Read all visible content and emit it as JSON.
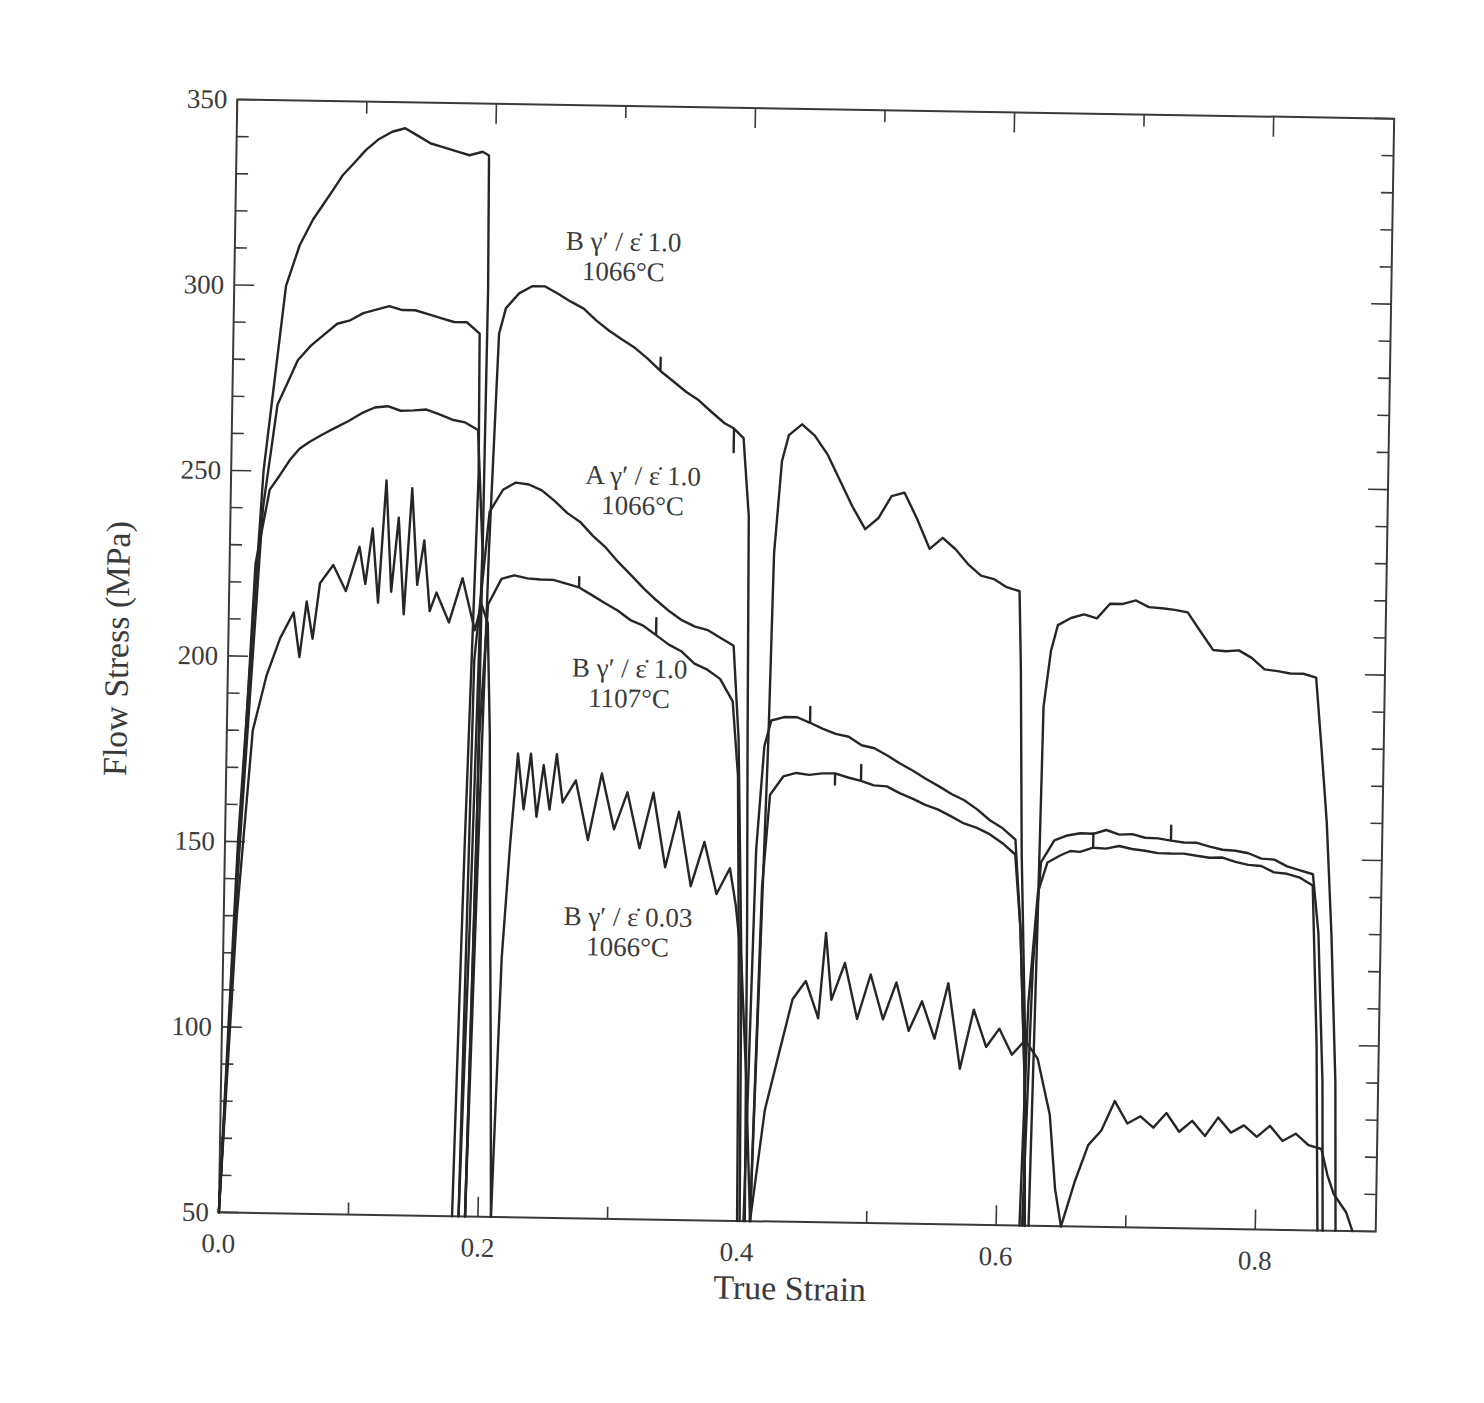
{
  "chart_data": {
    "type": "line",
    "title": "",
    "xlabel": "True Strain",
    "ylabel": "Flow Stress  (MPa)",
    "xlim": [
      0.0,
      0.893
    ],
    "ylim": [
      50,
      350
    ],
    "grid": false,
    "legend": "none (curves labelled by inline annotations)",
    "x_ticks": {
      "major": [
        0.0,
        0.2,
        0.4,
        0.6,
        0.8
      ],
      "minor_step": 0.1,
      "labels": [
        "0.0",
        "0.2",
        "0.4",
        "0.6",
        "0.8"
      ]
    },
    "y_ticks": {
      "major": [
        50,
        100,
        150,
        200,
        250,
        300,
        350
      ],
      "minor_step": 10,
      "labels": [
        "50",
        "100",
        "150",
        "200",
        "250",
        "300",
        "350"
      ]
    },
    "annotations": [
      {
        "line1": "B γ′ / ε̇ 1.0",
        "line2": "1066°C",
        "x": 0.3,
        "y": 311
      },
      {
        "line1": "A γ′ / ε̇ 1.0",
        "line2": "1066°C",
        "x": 0.318,
        "y": 248
      },
      {
        "line1": "B γ′ / ε̇ 1.0",
        "line2": "1107°C",
        "x": 0.31,
        "y": 196
      },
      {
        "line1": "B γ′ / ε̇ 0.03",
        "line2": "1066°C",
        "x": 0.312,
        "y": 129
      }
    ],
    "series": [
      {
        "name": "B γ′ / ε̇ 1.0, 1066°C",
        "passes": [
          {
            "x": [
              0.0,
              0.01,
              0.025,
              0.04,
              0.05,
              0.06,
              0.075,
              0.09,
              0.1,
              0.11,
              0.12,
              0.13,
              0.14,
              0.15,
              0.16,
              0.17,
              0.18,
              0.19,
              0.195,
              0.196,
              0.194,
              0.19
            ],
            "y": [
              50,
              150,
              250,
              300,
              311,
              318,
              326,
              333,
              337,
              340,
              342,
              343,
              341,
              339,
              338,
              337,
              336,
              337,
              336,
              300,
              150,
              50
            ]
          },
          {
            "x": [
              0.19,
              0.2,
              0.205,
              0.21,
              0.22,
              0.23,
              0.24,
              0.26,
              0.28,
              0.3,
              0.32,
              0.34,
              0.36,
              0.38,
              0.395,
              0.4,
              0.402,
              0.404,
              0.405,
              0.406
            ],
            "y": [
              50,
              230,
              288,
              295,
              299,
              301,
              301,
              297,
              292,
              287,
              282,
              276,
              271,
              265,
              261,
              240,
              180,
              130,
              90,
              50
            ]
          },
          {
            "x": [
              0.41,
              0.418,
              0.42,
              0.425,
              0.43,
              0.44,
              0.45,
              0.46,
              0.47,
              0.48,
              0.49,
              0.5,
              0.51,
              0.52,
              0.53,
              0.54,
              0.55,
              0.56,
              0.57,
              0.58,
              0.6,
              0.61,
              0.612,
              0.615,
              0.62,
              0.622
            ],
            "y": [
              50,
              180,
              230,
              255,
              262,
              265,
              262,
              257,
              250,
              243,
              237,
              240,
              246,
              247,
              240,
              232,
              235,
              232,
              228,
              225,
              222,
              221,
              200,
              150,
              100,
              50
            ]
          },
          {
            "x": [
              0.625,
              0.628,
              0.63,
              0.635,
              0.64,
              0.65,
              0.66,
              0.67,
              0.68,
              0.69,
              0.7,
              0.72,
              0.74,
              0.75,
              0.76,
              0.78,
              0.8,
              0.82,
              0.83,
              0.84,
              0.845,
              0.85,
              0.855,
              0.86,
              0.862
            ],
            "y": [
              50,
              130,
              190,
              205,
              212,
              214,
              215,
              214,
              218,
              218,
              219,
              217,
              216,
              211,
              206,
              206,
              201,
              200,
              200,
              199,
              180,
              160,
              130,
              90,
              50
            ]
          }
        ]
      },
      {
        "name": "A γ′ / ε̇ 1.0, 1066°C",
        "passes": [
          {
            "x": [
              0.0,
              0.01,
              0.025,
              0.035,
              0.05,
              0.06,
              0.07,
              0.08,
              0.09,
              0.1,
              0.11,
              0.12,
              0.13,
              0.14,
              0.15,
              0.16,
              0.17,
              0.18,
              0.19,
              0.191,
              0.185,
              0.18
            ],
            "y": [
              50,
              140,
              240,
              268,
              280,
              284,
              287,
              290,
              291,
              293,
              294,
              295,
              294,
              294,
              293,
              292,
              291,
              291,
              288,
              250,
              150,
              50
            ]
          },
          {
            "x": [
              0.185,
              0.19,
              0.2,
              0.21,
              0.22,
              0.24,
              0.26,
              0.28,
              0.3,
              0.32,
              0.34,
              0.36,
              0.38,
              0.39,
              0.395,
              0.4,
              0.402
            ],
            "y": [
              50,
              200,
              240,
              246,
              248,
              246,
              240,
              234,
              227,
              220,
              214,
              210,
              207,
              205,
              180,
              120,
              50
            ]
          },
          {
            "x": [
              0.405,
              0.41,
              0.415,
              0.42,
              0.43,
              0.44,
              0.46,
              0.48,
              0.5,
              0.52,
              0.54,
              0.56,
              0.58,
              0.6,
              0.61,
              0.615,
              0.62,
              0.622
            ],
            "y": [
              50,
              150,
              178,
              185,
              186,
              186,
              183,
              181,
              178,
              174,
              170,
              166,
              162,
              157,
              154,
              130,
              90,
              50
            ]
          },
          {
            "x": [
              0.62,
              0.625,
              0.63,
              0.64,
              0.66,
              0.68,
              0.7,
              0.72,
              0.74,
              0.76,
              0.78,
              0.8,
              0.82,
              0.83,
              0.84,
              0.845,
              0.85,
              0.852
            ],
            "y": [
              50,
              120,
              148,
              154,
              156,
              157,
              156,
              155,
              154,
              153,
              152,
              150,
              148,
              147,
              146,
              130,
              90,
              50
            ]
          }
        ]
      },
      {
        "name": "B γ′ / ε̇ 1.0, 1107°C",
        "passes": [
          {
            "x": [
              0.0,
              0.01,
              0.02,
              0.03,
              0.045,
              0.06,
              0.08,
              0.1,
              0.12,
              0.14,
              0.16,
              0.18,
              0.19,
              0.195,
              0.19,
              0.185
            ],
            "y": [
              50,
              140,
              225,
              245,
              253,
              258,
              262,
              266,
              268,
              267,
              266,
              264,
              262,
              230,
              130,
              50
            ]
          },
          {
            "x": [
              0.19,
              0.195,
              0.2,
              0.21,
              0.22,
              0.24,
              0.26,
              0.28,
              0.3,
              0.32,
              0.34,
              0.36,
              0.38,
              0.39,
              0.395,
              0.398,
              0.4
            ],
            "y": [
              50,
              180,
              215,
              222,
              223,
              222,
              221,
              218,
              214,
              210,
              205,
              200,
              196,
              190,
              170,
              120,
              50
            ]
          },
          {
            "x": [
              0.41,
              0.415,
              0.42,
              0.43,
              0.44,
              0.46,
              0.48,
              0.5,
              0.52,
              0.54,
              0.56,
              0.58,
              0.6,
              0.61,
              0.615,
              0.62,
              0.622
            ],
            "y": [
              50,
              140,
              165,
              170,
              171,
              171,
              170,
              168,
              166,
              163,
              160,
              157,
              153,
              150,
              130,
              90,
              50
            ]
          },
          {
            "x": [
              0.618,
              0.622,
              0.628,
              0.635,
              0.645,
              0.66,
              0.68,
              0.7,
              0.72,
              0.74,
              0.76,
              0.78,
              0.8,
              0.82,
              0.83,
              0.84,
              0.845,
              0.848
            ],
            "y": [
              50,
              110,
              140,
              148,
              150,
              151,
              152,
              152,
              151,
              151,
              150,
              149,
              148,
              146,
              145,
              143,
              100,
              50
            ]
          }
        ]
      },
      {
        "name": "B γ′ / ε̇ 0.03, 1066°C",
        "passes": [
          {
            "x": [
              0.0,
              0.01,
              0.02,
              0.03,
              0.04,
              0.05,
              0.055,
              0.06,
              0.065,
              0.07,
              0.08,
              0.09,
              0.1,
              0.105,
              0.11,
              0.115,
              0.12,
              0.125,
              0.13,
              0.135,
              0.14,
              0.145,
              0.15,
              0.155,
              0.16,
              0.17,
              0.18,
              0.19,
              0.195,
              0.2,
              0.203,
              0.205,
              0.208,
              0.21
            ],
            "y": [
              50,
              130,
              180,
              195,
              205,
              212,
              200,
              215,
              205,
              220,
              225,
              218,
              230,
              220,
              235,
              215,
              248,
              218,
              238,
              212,
              246,
              220,
              232,
              213,
              218,
              210,
              222,
              208,
              215,
              210,
              180,
              140,
              90,
              50
            ]
          },
          {
            "x": [
              0.21,
              0.215,
              0.22,
              0.225,
              0.23,
              0.235,
              0.24,
              0.245,
              0.25,
              0.255,
              0.26,
              0.27,
              0.28,
              0.29,
              0.3,
              0.31,
              0.32,
              0.33,
              0.34,
              0.35,
              0.36,
              0.37,
              0.38,
              0.39,
              0.395,
              0.4,
              0.405,
              0.41
            ],
            "y": [
              50,
              120,
              150,
              175,
              160,
              175,
              158,
              172,
              160,
              175,
              162,
              168,
              152,
              170,
              155,
              165,
              150,
              165,
              145,
              160,
              140,
              152,
              138,
              145,
              135,
              120,
              90,
              50
            ]
          },
          {
            "x": [
              0.41,
              0.42,
              0.43,
              0.44,
              0.45,
              0.46,
              0.465,
              0.47,
              0.48,
              0.49,
              0.5,
              0.51,
              0.52,
              0.53,
              0.54,
              0.55,
              0.56,
              0.57,
              0.58,
              0.59,
              0.6,
              0.61,
              0.62,
              0.63,
              0.64,
              0.645,
              0.65
            ],
            "y": [
              50,
              80,
              95,
              110,
              115,
              105,
              128,
              110,
              120,
              105,
              117,
              105,
              115,
              102,
              110,
              100,
              115,
              92,
              108,
              98,
              103,
              96,
              100,
              95,
              80,
              60,
              50
            ]
          },
          {
            "x": [
              0.65,
              0.66,
              0.67,
              0.68,
              0.69,
              0.7,
              0.71,
              0.72,
              0.73,
              0.74,
              0.75,
              0.76,
              0.77,
              0.78,
              0.79,
              0.8,
              0.81,
              0.82,
              0.83,
              0.84,
              0.85,
              0.855,
              0.86,
              0.87,
              0.875
            ],
            "y": [
              50,
              62,
              72,
              76,
              84,
              78,
              80,
              77,
              81,
              76,
              79,
              75,
              80,
              76,
              78,
              75,
              78,
              74,
              76,
              73,
              72,
              65,
              60,
              55,
              50
            ]
          }
        ]
      }
    ]
  }
}
